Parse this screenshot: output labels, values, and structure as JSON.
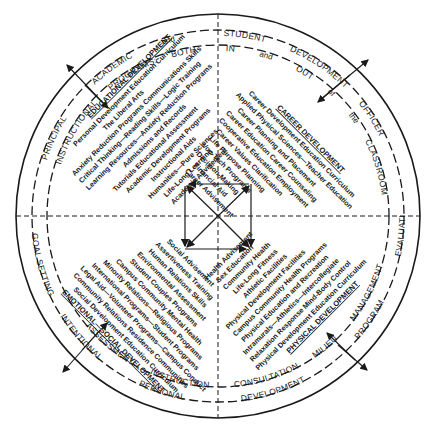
{
  "outer_ring": {
    "top_left": [
      "PRINCIPAL",
      "ACADEMIC",
      "and"
    ],
    "top_right": [
      "STUDENT",
      "DEVELOPMENT",
      "OFFICER"
    ],
    "bottom_right": [
      "EVALUATION",
      "PROGRAM",
      "DEVELOPMENT"
    ],
    "bottom_left": [
      "GOAL SETTING",
      "INTENTIONAL",
      "PERSONAL"
    ]
  },
  "middle_ring": {
    "top_left": [
      "INSTRUCTIONAL",
      "PROGRAMS:",
      "BOTH"
    ],
    "top_right": [
      "IN",
      "and",
      "OUT",
      "of",
      "the",
      "CLASSROOM"
    ],
    "bottom_right": [
      "MANAGEMENT",
      "MILIEU",
      "CONSULTATION"
    ],
    "bottom_left": [
      "ASSESSMENT",
      "INSTRUCTION"
    ]
  },
  "quadrants": {
    "educational": {
      "heading": "EDUCATIONAL DEVELOPMENT",
      "items": [
        "Personal Development Education Curriculum",
        "The Liberal Arts",
        "Anxiety Reduction Programs   Communications Skills",
        "Critical Thinking—Reading Skills—Logic Training",
        "Learning Resources—Anxiety Reduction Programs",
        "Admissions and Records",
        "Tutorials   Educational Assessment",
        "Academic Development Programs",
        "Instructional Aids",
        "Humanities—Pure Sciences",
        "Life-Long Learning",
        "Academic Advisement"
      ]
    },
    "career": {
      "heading": "CAREER DEVELOPMENT",
      "items": [
        "Career Development Education Curriculum",
        "Applied Physical Sciences—Teacher Education",
        "Career Planning and Placement",
        "Career Education   Career Counseling",
        "Cooperative Education   Employment",
        "Career Values Clarification",
        "Life Purpose Planning",
        "Voc-Tech Programs",
        "Decision-Making",
        "Financial Aid",
        "Career Advisement"
      ]
    },
    "social": {
      "heading": "EMOTIONAL—SOCIAL DEVELOPMENT",
      "items": [
        "Social Advisement",
        "Assertiveness Training",
        "Human Relations Skills",
        "Environmental Assessment",
        "Student Couples Programs",
        "Campus Community Mental Health",
        "Minority Relations—Religious Programs",
        "International Programs—Student Programs",
        "Legal Aid—Volunteer Programs—Campus Conduct",
        "Community Relations   Residence Communities",
        "Social Development Education Curriculum"
      ]
    },
    "physical": {
      "heading": "PHYSICAL DEVELOPMENT",
      "items": [
        "Health Advisement",
        "Sex Education",
        "Community Health",
        "Life-Long Fitness",
        "Athletic Facilities",
        "Physical Development Facilities",
        "Campus Community Health Programs",
        "Physical Education and Recreation",
        "Intramurals—Athletics—Intercollegiate",
        "Relaxation Response   Mind-Body Control",
        "Physical Development Education Curriculum"
      ]
    }
  },
  "colors": {
    "ink": "#1a1a1a",
    "paper": "#ffffff"
  }
}
